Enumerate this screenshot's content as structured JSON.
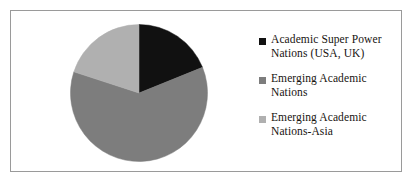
{
  "figure": {
    "background_color": "#ffffff",
    "frame_color": "#9a9a9a"
  },
  "chart_data": {
    "type": "pie",
    "title": "",
    "subtitle": "",
    "xlabel": "",
    "ylabel": "",
    "grid": false,
    "legend_position": "right",
    "start_angle_deg": 0,
    "direction": "clockwise",
    "categories": [
      "Academic Super Power Nations (USA, UK)",
      "Emerging Academic Nations",
      "Emerging Academic Nations-Asia"
    ],
    "values": [
      19,
      61,
      20
    ],
    "value_unit": "percent",
    "slice_angles_deg": [
      68,
      220,
      72
    ],
    "colors": [
      "#111111",
      "#7d7d7d",
      "#b0b0b0"
    ],
    "data_labels_shown": false
  },
  "legend": {
    "items": [
      {
        "marker": "filled-square-marker",
        "color": "#111111",
        "label": "Academic Super Power\nNations (USA, UK)"
      },
      {
        "marker": "filled-square-marker",
        "color": "#7d7d7d",
        "label": "Emerging Academic\nNations"
      },
      {
        "marker": "filled-square-marker",
        "color": "#b0b0b0",
        "label": "Emerging Academic\nNations-Asia"
      }
    ]
  }
}
